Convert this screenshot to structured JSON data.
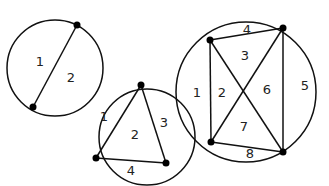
{
  "diagram": {
    "circles": [
      {
        "name": "two-points",
        "cx": 55,
        "cy": 68,
        "r": 48,
        "points": [
          [
            77,
            25
          ],
          [
            33,
            107
          ]
        ],
        "chords": [
          [
            0,
            1
          ]
        ],
        "regions": [
          {
            "label": "1",
            "x": 40,
            "y": 62
          },
          {
            "label": "2",
            "x": 71,
            "y": 78
          }
        ]
      },
      {
        "name": "three-points",
        "cx": 147,
        "cy": 137,
        "r": 48,
        "points": [
          [
            141,
            85
          ],
          [
            96,
            158
          ],
          [
            166,
            163
          ]
        ],
        "chords": [
          [
            0,
            1
          ],
          [
            1,
            2
          ],
          [
            2,
            0
          ]
        ],
        "regions": [
          {
            "label": "1",
            "x": 104,
            "y": 117
          },
          {
            "label": "2",
            "x": 135,
            "y": 135
          },
          {
            "label": "3",
            "x": 164,
            "y": 123
          },
          {
            "label": "4",
            "x": 131,
            "y": 171
          }
        ]
      },
      {
        "name": "four-points",
        "cx": 246,
        "cy": 92,
        "r": 70,
        "points": [
          [
            210,
            40
          ],
          [
            283,
            28
          ],
          [
            211,
            142
          ],
          [
            283,
            152
          ]
        ],
        "chords": [
          [
            0,
            1
          ],
          [
            0,
            2
          ],
          [
            0,
            3
          ],
          [
            1,
            2
          ],
          [
            1,
            3
          ],
          [
            2,
            3
          ]
        ],
        "regions": [
          {
            "label": "4",
            "x": 247,
            "y": 30
          },
          {
            "label": "3",
            "x": 245,
            "y": 56
          },
          {
            "label": "1",
            "x": 197,
            "y": 93
          },
          {
            "label": "2",
            "x": 222,
            "y": 93
          },
          {
            "label": "6",
            "x": 267,
            "y": 90
          },
          {
            "label": "5",
            "x": 305,
            "y": 86
          },
          {
            "label": "7",
            "x": 244,
            "y": 127
          },
          {
            "label": "8",
            "x": 250,
            "y": 154
          }
        ]
      }
    ],
    "colors": {
      "stroke": "#111111",
      "point": "#000000",
      "label": "#222222",
      "background": "#ffffff"
    }
  }
}
